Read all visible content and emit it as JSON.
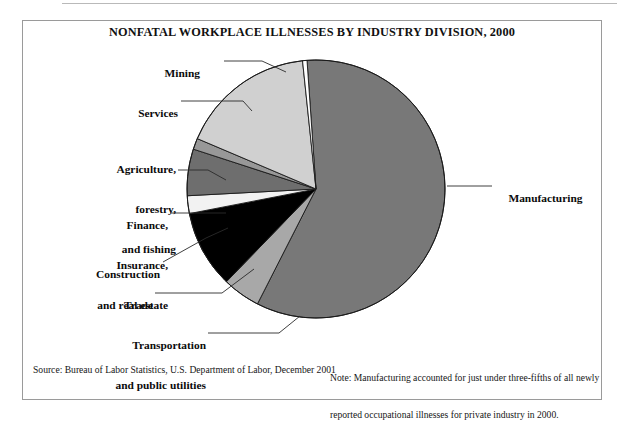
{
  "figure": {
    "title": "NONFATAL WORKPLACE ILLNESSES BY INDUSTRY DIVISION, 2000",
    "source": "Source: Bureau of Labor Statistics, U.S. Department of Labor, December 2001",
    "note_line1": "Note: Manufacturing accounted for just under three-fifths of all newly",
    "note_line2": "reported occupational illnesses for private industry in 2000."
  },
  "labels": {
    "mining": "Mining",
    "services": "Services",
    "agriculture_l1": "Agriculture,",
    "agriculture_l2": "forestry,",
    "agriculture_l3": "and fishing",
    "finance_l1": "Finance,",
    "finance_l2": "Insurance,",
    "finance_l3": "and real estate",
    "construction": "Construction",
    "trade": "Trade",
    "transportation_l1": "Transportation",
    "transportation_l2": "and public utilities",
    "manufacturing": "Manufacturing"
  },
  "colors": {
    "manufacturing": "#787878",
    "mining": "#ffffff",
    "services": "#d0d0d0",
    "agriculture": "#989898",
    "finance": "#6e6e6e",
    "construction": "#f2f2f2",
    "trade": "#000000",
    "transportation": "#a8a8a8",
    "outline": "#1a1a1a",
    "leader": "#2a2a2a",
    "frame": "#9a9a9a"
  },
  "chart_data": {
    "type": "pie",
    "title": "NONFATAL WORKPLACE ILLNESSES BY INDUSTRY DIVISION, 2000",
    "unit": "percent of newly reported occupational illnesses, private industry",
    "legend": "none (direct labels with leader lines)",
    "center": {
      "x": 316,
      "y": 189
    },
    "radius": 129,
    "start_angle_deg": -4,
    "direction": "clockwise",
    "categories": [
      "Manufacturing",
      "Transportation and public utilities",
      "Trade",
      "Construction",
      "Finance, Insurance, and real estate",
      "Agriculture, forestry, and fishing",
      "Services",
      "Mining"
    ],
    "values": [
      58.6,
      4.7,
      9.7,
      2.2,
      5.8,
      1.4,
      17.0,
      0.6
    ],
    "slices": [
      {
        "name": "Manufacturing",
        "value": 58.6,
        "color": "#787878",
        "start_deg": -4,
        "sweep_deg": 211.0
      },
      {
        "name": "Transportation and public utilities",
        "value": 4.7,
        "color": "#a8a8a8",
        "start_deg": 207.0,
        "sweep_deg": 17.0
      },
      {
        "name": "Trade",
        "value": 9.7,
        "color": "#000000",
        "start_deg": 224.0,
        "sweep_deg": 35.0
      },
      {
        "name": "Construction",
        "value": 2.2,
        "color": "#f2f2f2",
        "start_deg": 259.0,
        "sweep_deg": 8.0
      },
      {
        "name": "Finance, Insurance, and real estate",
        "value": 5.8,
        "color": "#6e6e6e",
        "start_deg": 267.0,
        "sweep_deg": 21.0
      },
      {
        "name": "Agriculture, forestry, and fishing",
        "value": 1.4,
        "color": "#989898",
        "start_deg": 288.0,
        "sweep_deg": 5.0
      },
      {
        "name": "Services",
        "value": 17.0,
        "color": "#d0d0d0",
        "start_deg": 293.0,
        "sweep_deg": 61.0
      },
      {
        "name": "Mining",
        "value": 0.6,
        "color": "#ffffff",
        "start_deg": 354.0,
        "sweep_deg": 2.0
      }
    ]
  }
}
